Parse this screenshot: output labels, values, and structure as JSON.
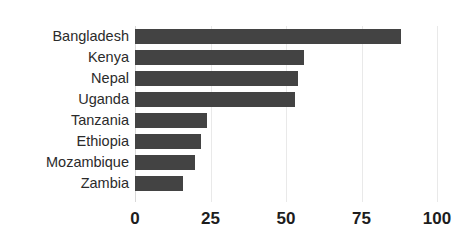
{
  "chart_data": {
    "type": "bar",
    "orientation": "horizontal",
    "title": "",
    "xlabel": "",
    "ylabel": "",
    "categories": [
      "Bangladesh",
      "Kenya",
      "Nepal",
      "Uganda",
      "Tanzania",
      "Ethiopia",
      "Mozambique",
      "Zambia"
    ],
    "values": [
      88,
      56,
      54,
      53,
      24,
      22,
      20,
      16
    ],
    "xlim": [
      0,
      100
    ],
    "xticks": [
      0,
      25,
      50,
      75,
      100
    ],
    "xtick_labels": [
      "0",
      "25",
      "50",
      "75",
      "100"
    ],
    "grid": "vertical-only",
    "legend": "none",
    "bar_color": "#434343",
    "gridline_color": "#e9e9e9",
    "background_color": "#ffffff"
  },
  "axes": {
    "x_ticks": [
      {
        "label": "0",
        "value": 0
      },
      {
        "label": "25",
        "value": 25
      },
      {
        "label": "50",
        "value": 50
      },
      {
        "label": "75",
        "value": 75
      },
      {
        "label": "100",
        "value": 100
      }
    ]
  }
}
